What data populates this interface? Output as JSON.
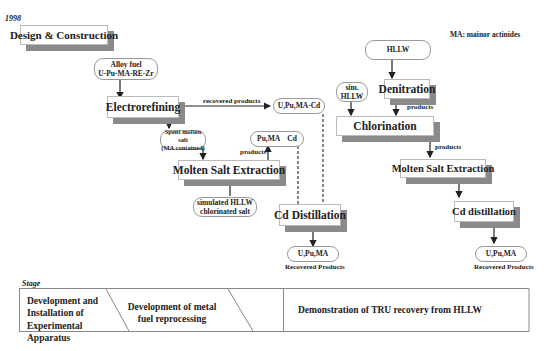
{
  "year": "1998",
  "note": "MA: mainor actinides",
  "left_flow": {
    "design_box": "Design & Construction",
    "alloy_fuel": [
      "Alloy fuel",
      "U-Pu-MA-RE-Zr"
    ],
    "electrorefining": "Electrorefining",
    "recovered_products_label": "recovered products",
    "u_pu_ma_cd": "U,Pu,MA-Cd",
    "spent_salt": [
      "Spent molten salt",
      "(MA contained)"
    ],
    "pu_ma_cd": "Pu,MA    Cd",
    "products_label": "products",
    "molten_salt_extraction": "Molten Salt Extraction",
    "simulated_hllw": [
      "simulated HLLW",
      "chlorinated salt"
    ],
    "cd_distillation": "Cd Distillation",
    "output": "U,Pu,MA",
    "recovered_products": "Recovered Products"
  },
  "right_flow": {
    "hllw": "HLLW",
    "sim_hllw": [
      "sim.",
      "HLLW"
    ],
    "denitration": "Denitration",
    "products_label_1": "products",
    "chlorination": "Chlorination",
    "products_label_2": "products",
    "molten_salt_extraction": "Molten Salt Extraction",
    "cd_distillation": "Cd distillation",
    "output": "U,Pu,MA",
    "recovered_products": "Recovered Products"
  },
  "stage": {
    "label": "Stage",
    "cells": [
      "Development and Installation of Experimental Apparatus",
      "Development of metal fuel reprocessing",
      "Demonstration of TRU recovery from HLLW"
    ]
  }
}
